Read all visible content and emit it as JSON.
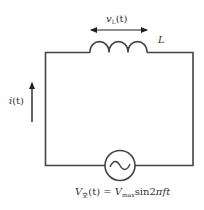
{
  "diagram": {
    "type": "circuit",
    "colors": {
      "wire": "#444444",
      "text": "#333333",
      "background": "#ffffff"
    },
    "components": {
      "inductor": {
        "label": "L",
        "turns": 3
      },
      "source": {
        "symbol": "ac-source",
        "glyph": "~"
      }
    },
    "labels": {
      "inductor_voltage": {
        "var": "v",
        "sub": "L",
        "arg": "(t)"
      },
      "inductor_name": "L",
      "current": {
        "var": "i",
        "arg": "(t)"
      },
      "source_equation": {
        "lhs_var": "V",
        "lhs_sub": "交",
        "lhs_arg": "(t)",
        "equals": "=",
        "rhs_var": "V",
        "rhs_sub": "max",
        "rhs_func": "sin2",
        "rhs_pi": "π",
        "rhs_tail": "ft"
      }
    }
  }
}
